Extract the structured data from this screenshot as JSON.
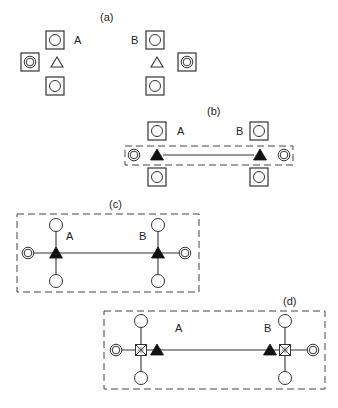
{
  "panels": [
    {
      "id": "a",
      "label": "(a)",
      "node_labels": [
        "A",
        "B"
      ]
    },
    {
      "id": "b",
      "label": "(b)",
      "node_labels": [
        "A",
        "B"
      ]
    },
    {
      "id": "c",
      "label": "(c)",
      "node_labels": [
        "A",
        "B"
      ]
    },
    {
      "id": "d",
      "label": "(d)",
      "node_labels": [
        "A",
        "B"
      ]
    }
  ],
  "colors": {
    "stroke": "#333333",
    "fill_dark": "#111111",
    "background": "#ffffff"
  }
}
